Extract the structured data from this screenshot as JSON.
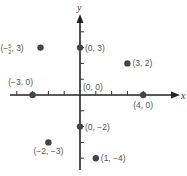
{
  "chart_data": {
    "type": "scatter",
    "title": "",
    "xlabel": "x",
    "ylabel": "y",
    "xlim": [
      -4.5,
      6
    ],
    "ylim": [
      -4.8,
      5
    ],
    "grid": false,
    "x_ticks": [
      -4,
      -3,
      -2,
      -1,
      1,
      2,
      3,
      4
    ],
    "y_ticks": [
      -4,
      -3,
      -2,
      -1,
      1,
      2,
      3,
      4
    ],
    "points": [
      {
        "x": -2.5,
        "y": 3,
        "label": "(−5/2, 3)",
        "label_display": {
          "prefix": "(−",
          "num": "5",
          "den": "2",
          "suffix": ", 3)"
        }
      },
      {
        "x": 0,
        "y": 3,
        "label": "(0, 3)"
      },
      {
        "x": 3,
        "y": 2,
        "label": "(3, 2)"
      },
      {
        "x": -3,
        "y": 0,
        "label": "(−3, 0)"
      },
      {
        "x": 0,
        "y": 0,
        "label": "(0, 0)"
      },
      {
        "x": 4,
        "y": 0,
        "label": "(4, 0)"
      },
      {
        "x": -2,
        "y": -3,
        "label": "(−2, −3)"
      },
      {
        "x": 0,
        "y": -2,
        "label": "(0, −2)"
      },
      {
        "x": 1,
        "y": -4,
        "label": "(1, −4)"
      }
    ],
    "colors": {
      "axis": "#222222",
      "point": "#444444",
      "label": "#555555"
    }
  }
}
